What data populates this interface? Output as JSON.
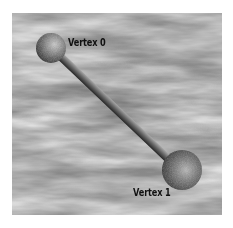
{
  "figure": {
    "background": "cloudy-sky",
    "colors": {
      "sky_dark": "#6e6e6e",
      "sky_mid": "#9a9a9a",
      "sky_light": "#d8d8d8",
      "sphere_light": "#bdbdbd",
      "sphere_dark": "#2a2a2a",
      "rod_light": "#9c9c9c",
      "rod_dark": "#2e2e2e",
      "label": "#111111"
    },
    "vertices": [
      {
        "label": "Vertex 0",
        "cx": 51,
        "cy": 48,
        "r": 15
      },
      {
        "label": "Vertex 1",
        "cx": 182,
        "cy": 170,
        "r": 20
      }
    ],
    "edge": {
      "from": 0,
      "to": 1
    }
  }
}
